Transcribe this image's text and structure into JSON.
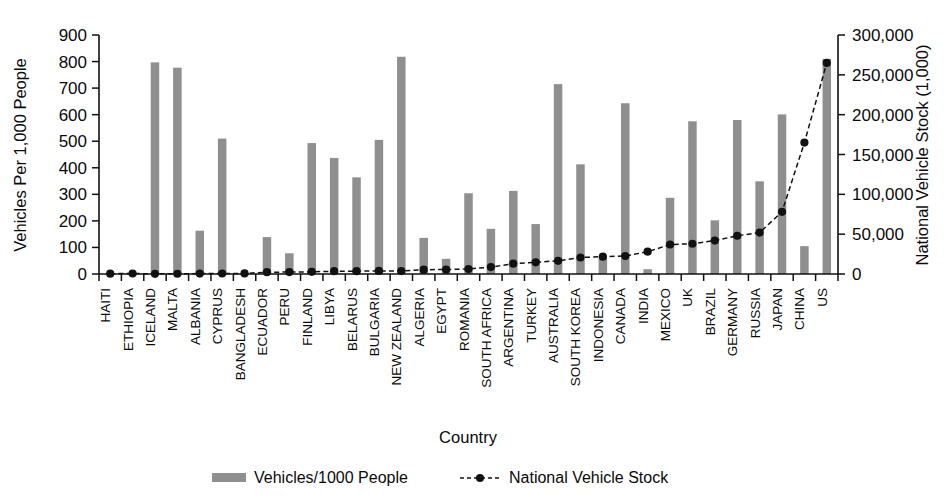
{
  "chart_data": {
    "type": "bar",
    "title": "",
    "xlabel": "Country",
    "ylabel": "Vehicles Per 1,000 People",
    "y2label": "National Vehicle Stock (1,000)",
    "ylim": [
      0,
      900
    ],
    "y2lim": [
      0,
      300000
    ],
    "grid": false,
    "legend_position": "bottom",
    "ytick_labels": [
      "900",
      "800",
      "700",
      "600",
      "500",
      "400",
      "300",
      "200",
      "100",
      "0"
    ],
    "ytick_values": [
      900,
      800,
      700,
      600,
      500,
      400,
      300,
      200,
      100,
      0
    ],
    "y2tick_labels": [
      "300,000",
      "250,000",
      "200,000",
      "150,000",
      "100,000",
      "50,000",
      "0"
    ],
    "y2tick_values": [
      300000,
      250000,
      200000,
      150000,
      100000,
      50000,
      0
    ],
    "categories": [
      "HAITI",
      "ETHIOPIA",
      "ICELAND",
      "MALTA",
      "ALBANIA",
      "CYPRUS",
      "BANGLADESH",
      "ECUADOR",
      "PERU",
      "FINLAND",
      "LIBYA",
      "BELARUS",
      "BULGARIA",
      "NEW ZEALAND",
      "ALGERIA",
      "EGYPT",
      "ROMANIA",
      "SOUTH AFRICA",
      "ARGENTINA",
      "TURKEY",
      "AUSTRALIA",
      "SOUTH KOREA",
      "INDONESIA",
      "CANADA",
      "INDIA",
      "MEXICO",
      "UK",
      "BRAZIL",
      "GERMANY",
      "RUSSIA",
      "JAPAN",
      "CHINA",
      "US"
    ],
    "series": [
      {
        "name": "Vehicles/1000 People",
        "type": "bar",
        "axis": "left",
        "color": "#8f8f8f",
        "values": [
          4,
          3,
          797,
          777,
          163,
          510,
          3,
          139,
          78,
          493,
          437,
          364,
          505,
          818,
          136,
          57,
          304,
          170,
          313,
          188,
          715,
          413,
          62,
          643,
          18,
          287,
          575,
          202,
          580,
          349,
          601,
          105,
          810
        ]
      },
      {
        "name": "National Vehicle Stock",
        "type": "line",
        "axis": "right",
        "color": "#111111",
        "marker": "circle",
        "dashed": true,
        "values": [
          400,
          600,
          270,
          320,
          520,
          620,
          700,
          2300,
          2400,
          2700,
          3500,
          3600,
          3800,
          3700,
          5400,
          5600,
          6300,
          8700,
          13000,
          14700,
          16600,
          20700,
          21800,
          22600,
          28000,
          37000,
          38000,
          42000,
          48000,
          52000,
          78000,
          165000,
          265000
        ]
      }
    ]
  },
  "legend": {
    "items": [
      {
        "label": "Vehicles/1000 People",
        "marker": "bar-swatch"
      },
      {
        "label": "National Vehicle Stock",
        "marker": "dashed-line-circle"
      }
    ]
  }
}
